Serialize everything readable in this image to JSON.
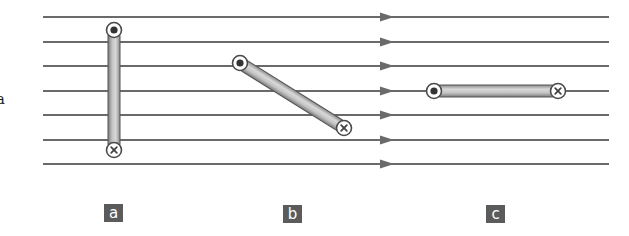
{
  "figure": {
    "field": {
      "line_y": [
        17,
        42,
        66,
        91,
        115,
        140,
        164
      ],
      "x_start": 43,
      "x_end": 609,
      "arrow_x": 380,
      "direction": "right",
      "color": "#6a6a6a"
    },
    "rods": [
      {
        "id": "a",
        "orientation": "vertical",
        "start": {
          "x": 114,
          "y": 30,
          "symbol": "dot-out-of-page"
        },
        "end": {
          "x": 114,
          "y": 150,
          "symbol": "cross-into-page"
        }
      },
      {
        "id": "b",
        "orientation": "diagonal",
        "start": {
          "x": 240,
          "y": 63,
          "symbol": "dot-out-of-page"
        },
        "end": {
          "x": 344,
          "y": 128,
          "symbol": "cross-into-page"
        }
      },
      {
        "id": "c",
        "orientation": "horizontal",
        "start": {
          "x": 434,
          "y": 91,
          "symbol": "dot-out-of-page"
        },
        "end": {
          "x": 558,
          "y": 91,
          "symbol": "cross-into-page"
        }
      }
    ],
    "labels": [
      {
        "text": "a",
        "x": 104,
        "y": 204
      },
      {
        "text": "b",
        "x": 283,
        "y": 205
      },
      {
        "text": "c",
        "x": 486,
        "y": 205
      }
    ],
    "stray_text": "a"
  }
}
